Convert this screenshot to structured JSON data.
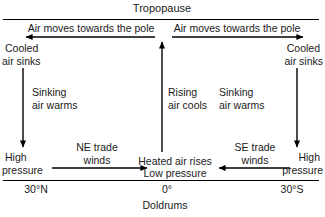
{
  "diagram": {
    "title": "Tropopause",
    "type": "atmospheric-circulation-hadley-cell",
    "boundaries": {
      "tropopause_label": "Tropopause",
      "surface_left_label": "30°N",
      "surface_center_label": "0°",
      "surface_right_label": "30°S",
      "surface_zone_label": "Doldrums"
    },
    "upper_flow": {
      "left_label": "Air moves towards the pole",
      "right_label": "Air moves towards the pole"
    },
    "left_cell": {
      "top_label_line1": "Cooled",
      "top_label_line2": "air sinks",
      "mid_label_line1": "Sinking",
      "mid_label_line2": "air warms",
      "surface_label_line1": "High",
      "surface_label_line2": "pressure",
      "wind_label_line1": "NE trade",
      "wind_label_line2": "winds"
    },
    "center_cell": {
      "mid_label_line1": "Rising",
      "mid_label_line2": "air cools",
      "surface_label_line1": "Heated air rises",
      "surface_label_line2": "Low pressure"
    },
    "right_cell": {
      "top_label_line1": "Cooled",
      "top_label_line2": "air sinks",
      "mid_label_line1": "Sinking",
      "mid_label_line2": "air warms",
      "surface_label_line1": "High",
      "surface_label_line2": "pressure",
      "wind_label_line1": "SE trade",
      "wind_label_line2": "winds"
    },
    "colors": {
      "ink": "#1a1a1a",
      "line": "#000000",
      "background": "#ffffff"
    }
  }
}
